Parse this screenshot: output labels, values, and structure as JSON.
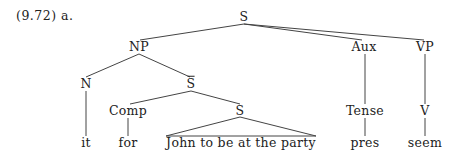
{
  "example": {
    "label": "(9.72) a."
  },
  "tree": {
    "root": "S",
    "nodes": {
      "s_root": "S",
      "np": "NP",
      "aux": "Aux",
      "vp": "VP",
      "n": "N",
      "s_bar": "S",
      "tense": "Tense",
      "v": "V",
      "comp": "Comp",
      "s_embedded": "S"
    },
    "leaves": {
      "it": "it",
      "for": "for",
      "clause": "John to be at the party",
      "pres": "pres",
      "seem": "seem"
    },
    "notes": {
      "s_bar_overline": true,
      "clause_as_triangle": true
    }
  },
  "colors": {
    "text": "#222222",
    "lines": "#444444",
    "background": "#ffffff"
  }
}
